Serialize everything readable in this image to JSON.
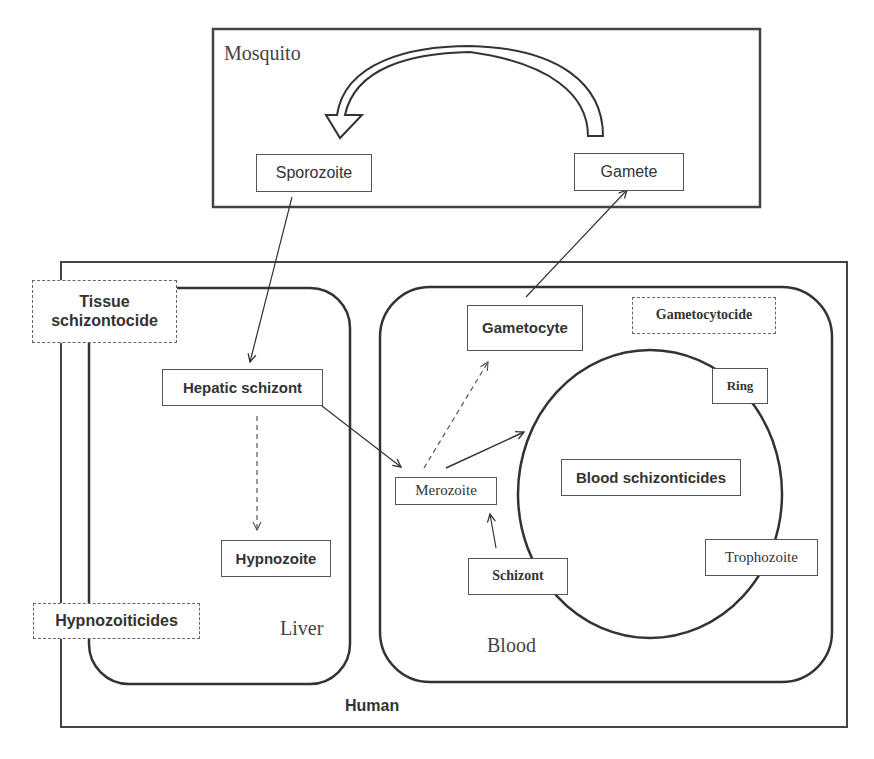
{
  "diagram": {
    "regions": {
      "mosquito": "Mosquito",
      "human": "Human",
      "liver": "Liver",
      "blood": "Blood"
    },
    "stages": {
      "sporozoite": "Sporozoite",
      "gamete": "Gamete",
      "hepatic_schizont": "Hepatic schizont",
      "hypnozoite": "Hypnozoite",
      "gametocyte": "Gametocyte",
      "merozoite": "Merozoite",
      "ring": "Ring",
      "trophozoite": "Trophozoite",
      "schizont": "Schizont"
    },
    "drug_classes": {
      "tissue_schizontocide": "Tissue schizontocide",
      "hypnozoiticides": "Hypnozoiticides",
      "gametocytocide": "Gametocytocide",
      "blood_schizonticides": "Blood schizonticides"
    },
    "edges": [
      {
        "from": "Gamete",
        "to": "Sporozoite",
        "style": "block-arrow"
      },
      {
        "from": "Sporozoite",
        "to": "Hepatic schizont",
        "style": "solid"
      },
      {
        "from": "Hepatic schizont",
        "to": "Hypnozoite",
        "style": "dashed"
      },
      {
        "from": "Hepatic schizont",
        "to": "Merozoite",
        "style": "solid"
      },
      {
        "from": "Merozoite",
        "to": "Gametocyte",
        "style": "dashed"
      },
      {
        "from": "Merozoite",
        "to": "Ring cycle",
        "style": "solid"
      },
      {
        "from": "Schizont",
        "to": "Merozoite",
        "style": "solid"
      },
      {
        "from": "Gametocyte",
        "to": "Gamete",
        "style": "solid"
      }
    ],
    "colors": {
      "line": "#333333",
      "box_border": "#555555",
      "text": "#333333"
    }
  }
}
